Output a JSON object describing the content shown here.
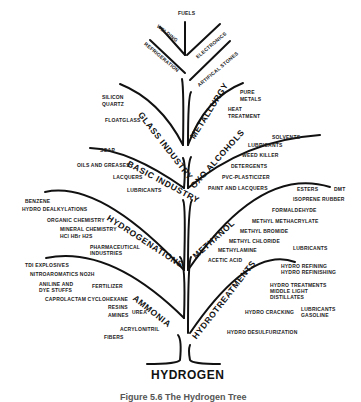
{
  "diagram": {
    "root": "HYDROGEN",
    "caption": "Figure 5.6 The Hydrogen Tree",
    "top": {
      "labels": [
        "FUELS",
        "WELDING",
        "ELECTRONICS",
        "REFRIGERATION",
        "ARTIFICAL STONES"
      ]
    },
    "branches": {
      "glass_industry": {
        "name": "GLASS INDUSTRY",
        "items": [
          "SILICON",
          "QUARTZ",
          "FLOATGLASS"
        ]
      },
      "metallurgy": {
        "name": "METALLURGY",
        "items": [
          "PURE",
          "METALS",
          "HEAT",
          "TREATMENT"
        ]
      },
      "basic_industry": {
        "name": "BASIC INDUSTRY",
        "items": [
          "SOAP",
          "OILS AND GREASES",
          "LACQUERS",
          "LUBRICANTS"
        ]
      },
      "oxo_alcohols": {
        "name": "OXO ALCOHOLS",
        "items": [
          "SOLVENTS",
          "LUBRICANTS",
          "WEED KILLER",
          "DETERGENTS",
          "PVC-PLASTICIZER",
          "PAINT AND LACQUERS"
        ]
      },
      "hydrogenations": {
        "name": "HYDROGENATIONS",
        "items": [
          "BENZENE",
          "HYDRO DEALKYLATIONS",
          "ORGANIC CHEMISTRY",
          "MINERAL CHEMISTRY",
          "HCl HBr H2S",
          "PHARMACEUTICAL",
          "INDUSTRIES"
        ]
      },
      "methanol": {
        "name": "METHANOL",
        "items": [
          "ESTERS",
          "DMT",
          "ISOPRENE RUBBER",
          "FORMALDEHYDE",
          "METHYL METHACRYLATE",
          "METHYL BROMIDE",
          "METHYL CHLORIDE",
          "METHYLAMINE",
          "ACETIC ACID",
          "LUBRICANTS"
        ]
      },
      "ammonia": {
        "name": "AMMONIA",
        "items": [
          "TDI EXPLOSIVES",
          "NITROAROMATICS NO2H",
          "ANILINE AND",
          "DYE STUFFS",
          "FERTILIZER",
          "CAPROLACTAM CYCLOHEXANE",
          "RESINS",
          "AMINES",
          "UREA",
          "ACRYLONITRIL",
          "FIBERS"
        ]
      },
      "hydrotreatments": {
        "name": "HYDROTREATMENTS",
        "items": [
          "HYDRO REFINING",
          "HYDRO REFINISHING",
          "HYDRO TREATMENTS",
          "MIDDLE LIGHT",
          "DISTILLATES",
          "HYDRO CRACKING",
          "LUBRICANTS",
          "GASOLINE",
          "HYDRO DESULFURIZATION"
        ]
      }
    }
  }
}
